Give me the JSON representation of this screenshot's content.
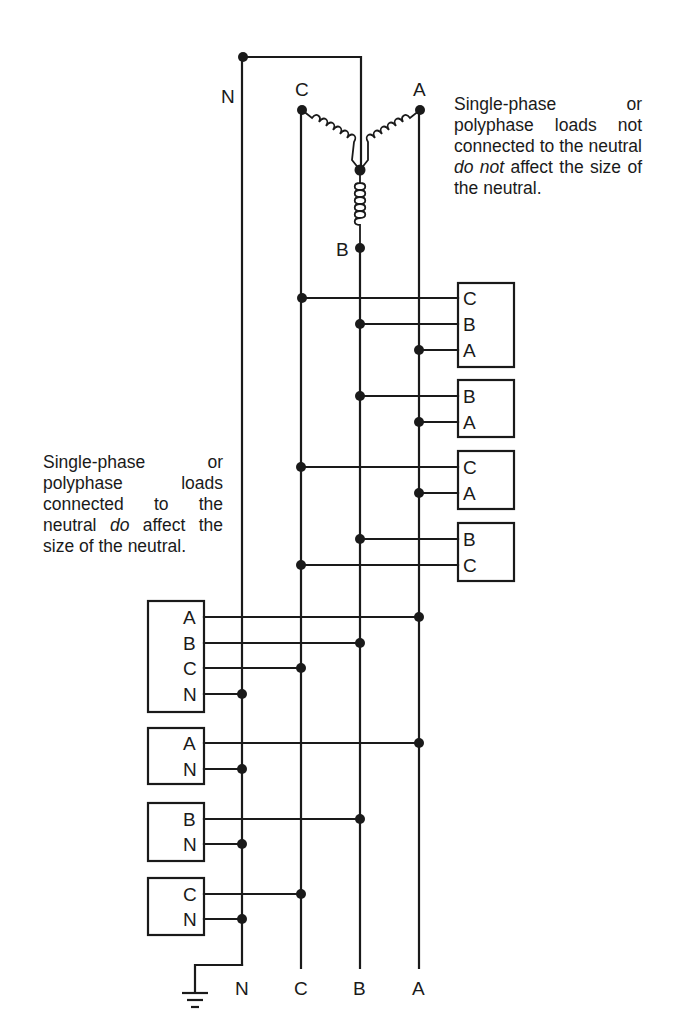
{
  "diagram": {
    "buses": [
      {
        "id": "N",
        "label": "N",
        "x": 242
      },
      {
        "id": "C",
        "label": "C",
        "x": 301
      },
      {
        "id": "B",
        "label": "B",
        "x": 360
      },
      {
        "id": "A",
        "label": "A",
        "x": 419
      }
    ],
    "source": {
      "type": "wye transformer",
      "terminal_labels": {
        "N": "N",
        "C": "C",
        "A": "A",
        "B": "B"
      }
    },
    "right_loads": [
      {
        "pins": [
          "C",
          "B",
          "A"
        ]
      },
      {
        "pins": [
          "B",
          "A"
        ]
      },
      {
        "pins": [
          "C",
          "A"
        ]
      },
      {
        "pins": [
          "B",
          "C"
        ]
      }
    ],
    "left_loads": [
      {
        "pins": [
          "A",
          "B",
          "C",
          "N"
        ]
      },
      {
        "pins": [
          "A",
          "N"
        ]
      },
      {
        "pins": [
          "B",
          "N"
        ]
      },
      {
        "pins": [
          "C",
          "N"
        ]
      }
    ],
    "bottom_labels": [
      "N",
      "C",
      "B",
      "A"
    ],
    "ground_symbol": "ground-icon"
  },
  "notes": {
    "right": {
      "before": "Single-phase or polyphase loads not connected to the neutral ",
      "emphasis": "do not",
      "after": " affect the size of the neutral."
    },
    "left": {
      "before": "Single-phase or polyphase loads connected to the neutral ",
      "emphasis": "do",
      "after": " affect the size of the neutral."
    }
  },
  "colors": {
    "ink": "#1a1a1a",
    "background": "#ffffff"
  }
}
